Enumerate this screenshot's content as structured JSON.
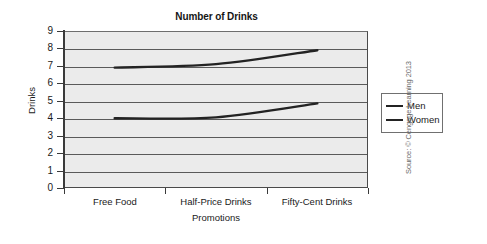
{
  "chart_data": {
    "type": "line",
    "title": "Number of Drinks",
    "xlabel": "Promotions",
    "ylabel": "Drinks",
    "categories": [
      "Free Food",
      "Half-Price Drinks",
      "Fifty-Cent Drinks"
    ],
    "series": [
      {
        "name": "Men",
        "values": [
          6.9,
          7.1,
          7.9
        ]
      },
      {
        "name": "Women",
        "values": [
          4.0,
          4.05,
          4.85
        ]
      }
    ],
    "ylim": [
      0,
      9
    ],
    "yticks": [
      "0",
      "1",
      "2",
      "3",
      "4",
      "5",
      "6",
      "7",
      "8",
      "9"
    ],
    "grid": "horizontal",
    "legend_position": "right",
    "colors": {
      "series_line": "#232323",
      "plot_background": "#ebebeb",
      "gridline": "#5a5a5a"
    }
  },
  "legend": {
    "entries": [
      {
        "label": "Men"
      },
      {
        "label": "Women"
      }
    ]
  },
  "credit": {
    "text": "Source: © Cengage Learning 2013"
  }
}
